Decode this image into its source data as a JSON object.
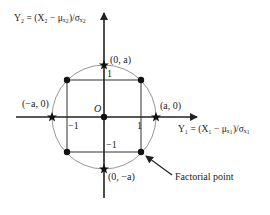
{
  "diagram": {
    "type": "central composite design (2 factors)",
    "y_axis_label": "Y₂ = (X₂ − μₓ₂)/σₓ₂",
    "x_axis_label": "Y₁ = (X₁ − μₓ₁)/σₓ₁",
    "origin_label": "O",
    "axial_points": [
      {
        "label": "(0, a)"
      },
      {
        "label": "(−a, 0)"
      },
      {
        "label": "(a, 0)"
      },
      {
        "label": "(0, −a)"
      }
    ],
    "tick_labels": {
      "top": "1",
      "right": "1",
      "left": "−1",
      "bottom": "−1"
    },
    "annotation": "Factorial point",
    "colors": {
      "axes": "#222222",
      "circle": "#888888",
      "square": "#333333",
      "points": "#111111"
    }
  }
}
